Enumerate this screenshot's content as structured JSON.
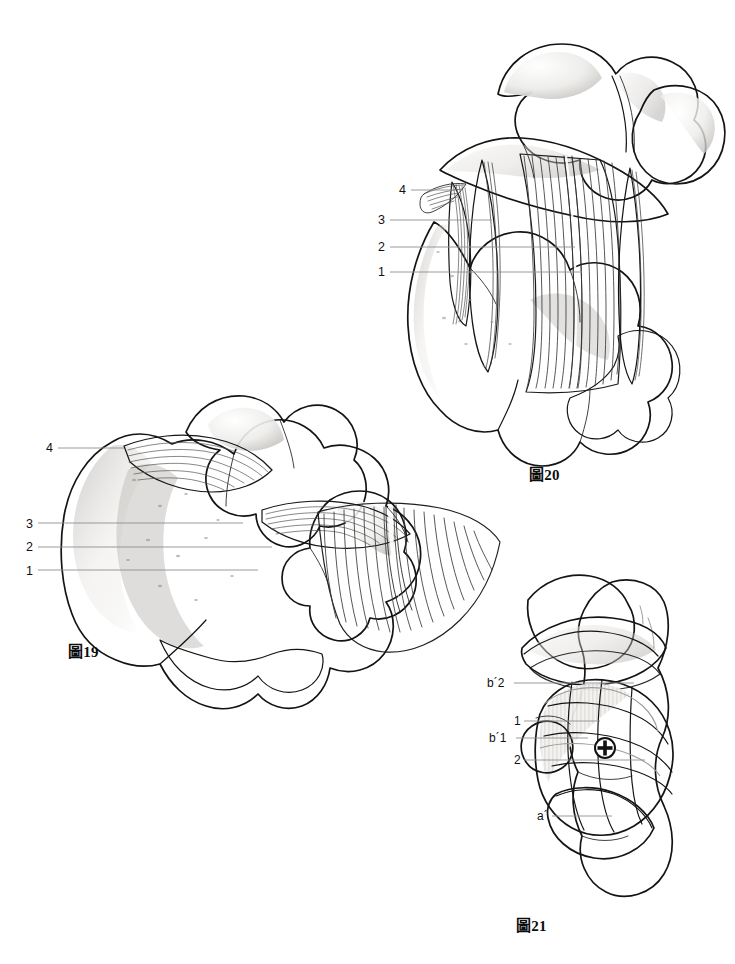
{
  "page": {
    "background_color": "#ffffff",
    "width": 735,
    "height": 964,
    "ink_color": "#1a1a1a",
    "leader_line_color": "#8a8a8a",
    "bone_fill_light": "#f0efed",
    "bone_fill_mid": "#dedcd9",
    "bone_fill_dark": "#c2bfbb",
    "bone_fill_darker": "#a9a6a2"
  },
  "figures": [
    {
      "id": "figure-19",
      "caption": "圖19",
      "caption_x": 68,
      "caption_y": 645,
      "labels": [
        {
          "key": "4",
          "text": "4",
          "x": 46,
          "y": 442,
          "leader_to_x": 124,
          "leader_to_y": 448
        },
        {
          "key": "3",
          "text": "3",
          "x": 26,
          "y": 518,
          "leader_to_x": 243,
          "leader_to_y": 523
        },
        {
          "key": "2",
          "text": "2",
          "x": 26,
          "y": 541,
          "leader_to_x": 272,
          "leader_to_y": 547
        },
        {
          "key": "1",
          "text": "1",
          "x": 26,
          "y": 565,
          "leader_to_x": 258,
          "leader_to_y": 570
        }
      ]
    },
    {
      "id": "figure-20",
      "caption": "圖20",
      "caption_x": 529,
      "caption_y": 468,
      "labels": [
        {
          "key": "4",
          "text": "4",
          "x": 399,
          "y": 184,
          "leader_to_x": 455,
          "leader_to_y": 190
        },
        {
          "key": "3",
          "text": "3",
          "x": 378,
          "y": 214,
          "leader_to_x": 492,
          "leader_to_y": 220
        },
        {
          "key": "2",
          "text": "2",
          "x": 378,
          "y": 241,
          "leader_to_x": 575,
          "leader_to_y": 247
        },
        {
          "key": "1",
          "text": "1",
          "x": 378,
          "y": 266,
          "leader_to_x": 582,
          "leader_to_y": 272
        }
      ]
    },
    {
      "id": "figure-21",
      "caption": "圖21",
      "caption_x": 516,
      "caption_y": 919,
      "labels": [
        {
          "key": "b2",
          "text": "b´2",
          "x": 487,
          "y": 677,
          "leader_to_x": 634,
          "leader_to_y": 683
        },
        {
          "key": "1",
          "text": "1",
          "x": 514,
          "y": 715,
          "leader_to_x": 600,
          "leader_to_y": 721
        },
        {
          "key": "b1",
          "text": "b´1",
          "x": 489,
          "y": 732,
          "leader_to_x": 588,
          "leader_to_y": 738
        },
        {
          "key": "2",
          "text": "2",
          "x": 514,
          "y": 754,
          "leader_to_x": 645,
          "leader_to_y": 760
        },
        {
          "key": "a",
          "text": "a´",
          "x": 537,
          "y": 810,
          "leader_to_x": 612,
          "leader_to_y": 816
        }
      ],
      "marker": {
        "name": "crosshair-marker",
        "x": 605,
        "y": 748,
        "radius": 10
      }
    }
  ]
}
